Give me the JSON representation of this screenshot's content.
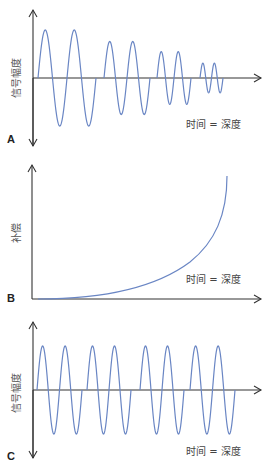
{
  "colors": {
    "wave": "#6a86c4",
    "axis": "#333333",
    "text": "#444444"
  },
  "panels": [
    {
      "id": "A",
      "label": "A",
      "ylabel": "信号幅度",
      "xlabel": "时间 = 深度"
    },
    {
      "id": "B",
      "label": "B",
      "ylabel": "补偿",
      "xlabel": "时间 = 深度"
    },
    {
      "id": "C",
      "label": "C",
      "ylabel": "信号幅度",
      "xlabel": "时间 = 深度"
    }
  ],
  "chart_data": [
    {
      "type": "line",
      "title": "A",
      "ylabel": "信号幅度",
      "xlabel": "时间 = 深度",
      "description": "Four groups of two-cycle sine bursts with decreasing amplitude (attenuated echoes)",
      "series": [
        {
          "name": "signal",
          "group_amplitudes": [
            1.0,
            0.76,
            0.55,
            0.31
          ]
        }
      ]
    },
    {
      "type": "line",
      "title": "B",
      "ylabel": "补偿",
      "xlabel": "时间 = 深度",
      "description": "Compensation curve rising exponentially with time/depth",
      "series": [
        {
          "name": "compensation",
          "shape": "exponential-increase"
        }
      ]
    },
    {
      "type": "line",
      "title": "C",
      "ylabel": "信号幅度",
      "xlabel": "时间 = 深度",
      "description": "Four groups of two-cycle sine bursts with equal amplitude after compensation",
      "series": [
        {
          "name": "signal",
          "group_amplitudes": [
            1.0,
            1.0,
            1.0,
            1.0
          ]
        }
      ]
    }
  ]
}
